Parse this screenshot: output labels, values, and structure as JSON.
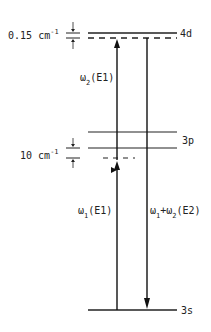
{
  "diagram": {
    "type": "energy-level-diagram",
    "levels": [
      {
        "name": "4d",
        "label": "4d",
        "y": 33,
        "dashed_y": 38
      },
      {
        "name": "3p",
        "label": "3p",
        "y_upper": 132,
        "y_lower": 148
      },
      {
        "name": "3s",
        "label": "3s",
        "y": 310
      }
    ],
    "splittings": [
      {
        "value": "0.15",
        "unit": "cm",
        "exponent": "-1"
      },
      {
        "value": "10",
        "unit": "cm",
        "exponent": "-1"
      }
    ],
    "transitions": [
      {
        "id": "omega2",
        "symbol": "ω",
        "subscript": "2",
        "type": "(E1)",
        "direction": "up"
      },
      {
        "id": "omega1",
        "symbol": "ω",
        "subscript": "1",
        "type": "(E1)",
        "direction": "up"
      },
      {
        "id": "omega12",
        "symbol": "ω",
        "subscript1": "1",
        "plus": "+",
        "symbol2": "ω",
        "subscript2": "2",
        "type": "(E2)",
        "direction": "down"
      }
    ]
  }
}
